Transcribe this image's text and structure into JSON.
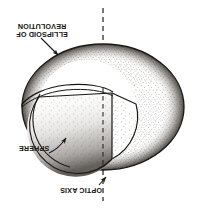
{
  "figure": {
    "orientation": "rotated-180",
    "background_color": "#ffffff",
    "ink_color": "#1a1714",
    "labels": {
      "ellipsoid": "ELLIPSOID OF\nREVOLUTION",
      "ellipsoid_line1": "ELLIPSOID OF",
      "ellipsoid_line2": "REVOLUTION",
      "sphere": "SPHERE",
      "optic_axis": "OPTIC AXIS"
    },
    "geometry": {
      "ellipsoid": {
        "center_x": 103,
        "center_y": 107,
        "radius_x": 81,
        "radius_y": 63
      },
      "sphere": {
        "center_x": 87,
        "center_y": 122,
        "radius": 48
      },
      "optic_axis": {
        "x": 103,
        "y_top": 8,
        "y_bottom": 201,
        "style": "dashed"
      },
      "cutaway": {
        "description": "quarter wedge removed from near-left of sphere",
        "corner_edge_x": 112,
        "corner_edge_y_top": 93,
        "corner_edge_y_bottom": 160
      }
    },
    "leaders": [
      {
        "name": "ellipsoid-leader",
        "from_x": 42,
        "from_y": 39,
        "to_x": 59,
        "to_y": 56,
        "arrow": true
      },
      {
        "name": "sphere-leader",
        "from_x": 50,
        "from_y": 152,
        "to_x": 66,
        "to_y": 137,
        "arrow": true
      },
      {
        "name": "optic-axis-leader",
        "from_x": 100,
        "from_y": 184,
        "to_x": 107,
        "to_y": 176,
        "arrow": true
      }
    ]
  }
}
